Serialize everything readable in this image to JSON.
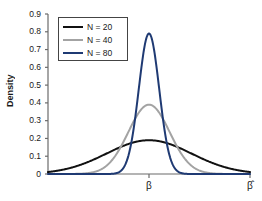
{
  "chart_data": {
    "type": "line",
    "title": "",
    "subtitle": "",
    "xlabel": "",
    "ylabel": "Density",
    "xlim": [
      -5,
      5
    ],
    "ylim": [
      0,
      0.9
    ],
    "grid": false,
    "legend_position": "top-left",
    "y_ticks": [
      "0.9",
      "0.8",
      "0.7",
      "0.6",
      "0.5",
      "0.4",
      "0.3",
      "0.2",
      "0.1",
      "0"
    ],
    "y_tick_values": [
      0.9,
      0.8,
      0.7,
      0.6,
      0.5,
      0.4,
      0.3,
      0.2,
      0.1,
      0
    ],
    "x_ticks": [
      {
        "label": "β",
        "value": 0,
        "name": "x-tick-beta"
      },
      {
        "label": "β̂",
        "value": 5,
        "name": "x-tick-beta-hat"
      }
    ],
    "series": [
      {
        "name": "N = 20",
        "color": "#111111",
        "width": 2.0,
        "mean": 0,
        "sigma": 2.1,
        "peak": 0.19,
        "edge_left_value": 0.045,
        "edge_right_value": 0.075
      },
      {
        "name": "N = 40",
        "color": "#a3a3a3",
        "width": 2.0,
        "mean": 0,
        "sigma": 1.02,
        "peak": 0.39,
        "edge_left_value": 0.0,
        "edge_right_value": 0.0
      },
      {
        "name": "N = 80",
        "color": "#1f3a73",
        "width": 2.0,
        "mean": 0,
        "sigma": 0.505,
        "peak": 0.79,
        "edge_left_value": 0.0,
        "edge_right_value": 0.0
      }
    ]
  },
  "legend": {
    "items": [
      {
        "label": "N = 20",
        "color": "#111111"
      },
      {
        "label": "N = 40",
        "color": "#a3a3a3"
      },
      {
        "label": "N = 80",
        "color": "#1f3a73"
      }
    ]
  },
  "axes": {
    "y_axis_label": "Density",
    "axis_color": "#6b6b6b"
  }
}
